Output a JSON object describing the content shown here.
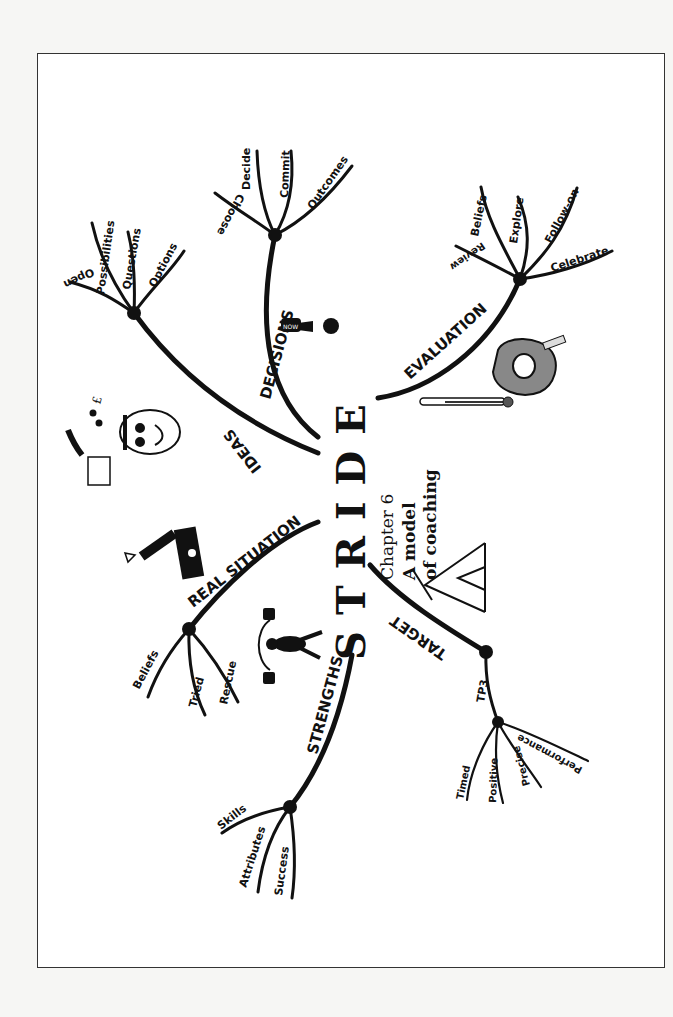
{
  "title": {
    "letters": [
      "S",
      "T",
      "R",
      "I",
      "D",
      "E"
    ],
    "chapter": "Chapter 6",
    "subtitle_line1": "A model",
    "subtitle_line2": "of coaching"
  },
  "branches": {
    "strengths": {
      "label": "STRENGTHS",
      "children": [
        "Skills",
        "Attributes",
        "Success"
      ]
    },
    "real_situation": {
      "label": "REAL SITUATION",
      "children": [
        "Beliefs",
        "Tried",
        "Rescue"
      ]
    },
    "ideas": {
      "label": "IDEAS",
      "children": [
        "Open",
        "Possibilities",
        "Questions",
        "Options"
      ]
    },
    "decisions": {
      "label": "DECISIONS",
      "children": [
        "Choose",
        "Decide",
        "Commit",
        "Outcomes"
      ]
    },
    "evaluation": {
      "label": "EVALUATION",
      "children": [
        "Review",
        "Beliefs",
        "Explore",
        "Follow-on",
        "Celebrate"
      ]
    },
    "target": {
      "label": "TARGET",
      "sub": "TP3",
      "children": [
        "Timed",
        "Positive",
        "Precise",
        "Performance"
      ]
    }
  },
  "icons": {
    "decisions_icon_text": "NOW",
    "ideas_icon_symbol": "£"
  }
}
